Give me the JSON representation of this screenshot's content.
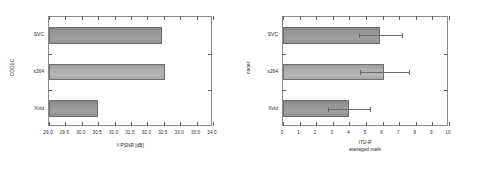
{
  "chart_data": [
    {
      "type": "bar",
      "orientation": "horizontal",
      "panel": "left",
      "title": "",
      "categories": [
        "SVC",
        "x264",
        "Xvid"
      ],
      "values": [
        32.45,
        32.55,
        30.5
      ],
      "xlabel": "Y-PSNR [dB]",
      "ylabel": "CODEC",
      "xlim": [
        29.0,
        34.0
      ],
      "xticks": [
        "29.0",
        "29.5",
        "30.0",
        "30.5",
        "31.0",
        "31.5",
        "32.0",
        "32.5",
        "33.0",
        "33.5",
        "34.0"
      ],
      "xtick_values": [
        29.0,
        29.5,
        30.0,
        30.5,
        31.0,
        31.5,
        32.0,
        32.5,
        33.0,
        33.5,
        34.0
      ],
      "grid": false,
      "legend": "none",
      "bar_color": "#a3a3a3",
      "bar_edge_color": "#6f6f6f",
      "error_bars": false
    },
    {
      "type": "bar",
      "orientation": "horizontal",
      "panel": "right",
      "title": "",
      "categories": [
        "SVC",
        "x264",
        "Xvid"
      ],
      "values": [
        5.85,
        6.1,
        4.0
      ],
      "err_low": [
        1.25,
        1.45,
        1.3
      ],
      "err_high": [
        1.3,
        1.5,
        1.25
      ],
      "xlabel_italic": "ITU-R",
      "xlabel": "averaged mark",
      "ylabel": "codec",
      "xlim": [
        0,
        10
      ],
      "xticks": [
        "0",
        "1",
        "2",
        "3",
        "4",
        "5",
        "6",
        "7",
        "8",
        "9",
        "10"
      ],
      "xtick_values": [
        0,
        1,
        2,
        3,
        4,
        5,
        6,
        7,
        8,
        9,
        10
      ],
      "grid": false,
      "legend": "none",
      "bar_color": "#a3a3a3",
      "bar_edge_color": "#6f6f6f",
      "error_bars": true,
      "error_bar_color": "#6a6a6a"
    }
  ]
}
